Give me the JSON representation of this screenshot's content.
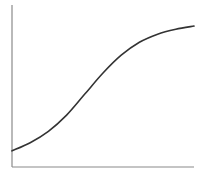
{
  "chart_data": {
    "type": "line",
    "title": "",
    "xlabel": "",
    "ylabel": "",
    "grid": false,
    "legend": null,
    "xticks": [],
    "yticks": [],
    "xlim": [
      0,
      1
    ],
    "ylim": [
      0,
      1
    ],
    "series": [
      {
        "name": "curve",
        "color": "#333333",
        "x": [
          0.0,
          0.1,
          0.2,
          0.3,
          0.4,
          0.5,
          0.6,
          0.7,
          0.8,
          0.9,
          1.0
        ],
        "y": [
          0.1,
          0.15,
          0.22,
          0.32,
          0.45,
          0.58,
          0.69,
          0.77,
          0.82,
          0.85,
          0.87
        ]
      }
    ]
  },
  "style": {
    "axis_color": "#8a8a8a",
    "line_color": "#333333",
    "background": "#ffffff"
  },
  "plot": {
    "left": 12,
    "right": 194,
    "top": 5,
    "bottom": 167
  }
}
